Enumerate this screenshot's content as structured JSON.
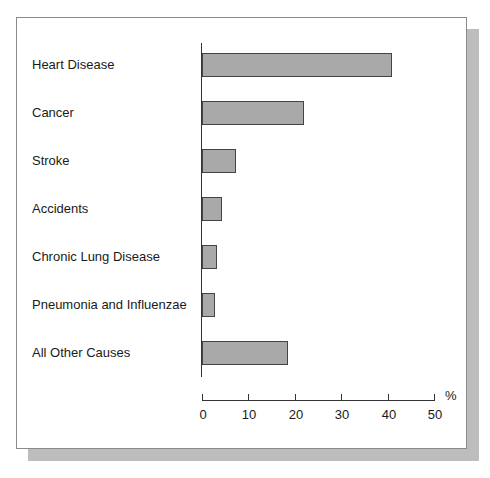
{
  "chart_data": {
    "type": "bar",
    "orientation": "horizontal",
    "title": "",
    "xlabel": "%",
    "ylabel": "",
    "xlim": [
      0,
      50
    ],
    "xticks": [
      0,
      10,
      20,
      30,
      40,
      50
    ],
    "xtick_labels": [
      "0",
      "10",
      "20",
      "30",
      "40",
      "50"
    ],
    "grid": false,
    "legend": null,
    "categories": [
      "Heart Disease",
      "Cancer",
      "Stroke",
      "Accidents",
      "Chronic Lung Disease",
      "Pneumonia and Influenzae",
      "All Other Causes"
    ],
    "values": [
      41,
      22,
      7.3,
      4.3,
      3.2,
      2.7,
      18.5
    ],
    "bar_color": "#a9a9a9",
    "bar_edge_color": "#444444"
  },
  "axis": {
    "unit_label": "%"
  }
}
